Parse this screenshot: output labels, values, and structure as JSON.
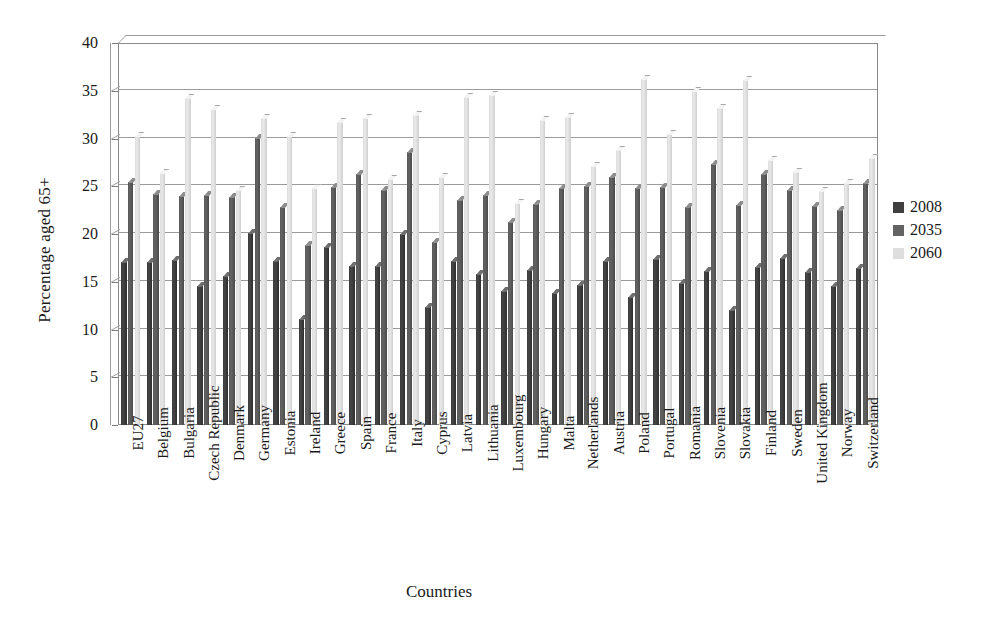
{
  "chart_data": {
    "type": "bar",
    "title": "",
    "xlabel": "Countries",
    "ylabel": "Percentage aged 65+",
    "ylim": [
      0,
      40
    ],
    "yticks": [
      0,
      5,
      10,
      15,
      20,
      25,
      30,
      35,
      40
    ],
    "grid": true,
    "legend_position": "right",
    "categories": [
      "EU27",
      "Belgium",
      "Bulgaria",
      "Czech Republic",
      "Denmark",
      "Germany",
      "Estonia",
      "Ireland",
      "Greece",
      "Spain",
      "France",
      "Italy",
      "Cyprus",
      "Latvia",
      "Lithuania",
      "Luxembourg",
      "Hungary",
      "Malta",
      "Netherlands",
      "Austria",
      "Poland",
      "Portugal",
      "Romania",
      "Slovenia",
      "Slovakia",
      "Finland",
      "Sweden",
      "United Kingdom",
      "Norway",
      "Switzerland"
    ],
    "series": [
      {
        "name": "2008",
        "color": "#3f3f3f",
        "values": [
          17.1,
          17.1,
          17.3,
          14.6,
          15.6,
          20.1,
          17.2,
          11.1,
          18.6,
          16.6,
          16.6,
          20.0,
          12.4,
          17.2,
          15.8,
          14.0,
          16.2,
          13.8,
          14.7,
          17.2,
          13.4,
          17.4,
          14.9,
          16.1,
          12.0,
          16.5,
          17.5,
          16.0,
          14.6,
          16.4
        ]
      },
      {
        "name": "2035",
        "color": "#636363",
        "values": [
          25.4,
          24.2,
          24.0,
          24.1,
          23.9,
          30.1,
          22.8,
          18.8,
          24.9,
          26.3,
          24.6,
          28.6,
          19.2,
          23.6,
          24.1,
          21.3,
          23.1,
          24.8,
          25.0,
          26.0,
          24.8,
          24.9,
          22.8,
          27.3,
          23.0,
          26.3,
          24.6,
          22.9,
          22.5,
          25.3
        ]
      },
      {
        "name": "2060",
        "color": "#dedede",
        "values": [
          30.3,
          26.4,
          34.2,
          33.1,
          24.6,
          32.2,
          30.3,
          24.8,
          31.7,
          32.2,
          25.8,
          32.5,
          26.0,
          34.3,
          34.6,
          23.2,
          31.9,
          32.3,
          27.1,
          28.8,
          36.2,
          30.5,
          35.0,
          33.2,
          36.1,
          27.8,
          26.5,
          24.5,
          25.3,
          28.0
        ]
      }
    ]
  },
  "legend": {
    "entries": [
      {
        "label": "2008"
      },
      {
        "label": "2035"
      },
      {
        "label": "2060"
      }
    ]
  }
}
